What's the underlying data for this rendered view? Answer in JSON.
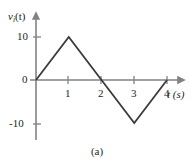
{
  "figure": {
    "caption": "(a)",
    "y_axis_label_main": "v",
    "y_axis_label_sub": "i",
    "y_axis_label_arg": "(t)",
    "x_axis_label": "t (s)",
    "axis_color": "#808285",
    "curve_color": "#3b3b3b",
    "text_color": "#231f20"
  },
  "chart_data": {
    "type": "line",
    "title": "",
    "subtitle": "",
    "xlabel": "t (s)",
    "ylabel": "v_i(t)",
    "x": [
      0,
      1,
      2,
      3,
      4
    ],
    "y": [
      0,
      10,
      0,
      -10,
      0
    ],
    "series": [
      {
        "name": "v_i(t)",
        "x": [
          0,
          1,
          2,
          3,
          4
        ],
        "values": [
          0,
          10,
          0,
          -10,
          0
        ]
      }
    ],
    "xlim": [
      0,
      4.55
    ],
    "ylim": [
      -13,
      13
    ],
    "xticks": [
      1,
      2,
      3,
      4
    ],
    "xtick_labels": [
      "1",
      "2",
      "3",
      "4"
    ],
    "yticks": [
      -10,
      0,
      10
    ],
    "ytick_labels": [
      "-10",
      "0",
      "10"
    ],
    "grid": false,
    "legend": false,
    "annotations": [
      "(a)"
    ]
  }
}
